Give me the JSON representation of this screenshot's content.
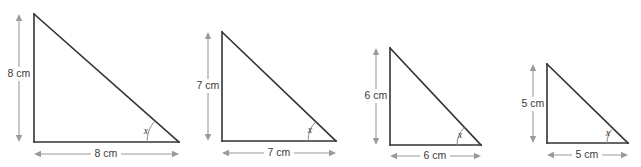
{
  "figure": {
    "type": "geometry-diagram",
    "background_color": "#ffffff",
    "line_color": "#333333",
    "dimension_color": "#9a9a9a",
    "text_color": "#3b3b3b",
    "triangles": [
      {
        "id": "triangle-1",
        "vertical_label": "8 cm",
        "horizontal_label": "8 cm",
        "angle_label": "x",
        "apex": {
          "x": 34,
          "y": 14
        },
        "right_angle": {
          "x": 34,
          "y": 142
        },
        "base_end": {
          "x": 179,
          "y": 142
        },
        "v_dim_x": 19,
        "h_dim_y": 154,
        "v_label_pos": {
          "x": 19,
          "y": 74
        },
        "h_label_pos": {
          "x": 106,
          "y": 154
        },
        "angle_radius": 32,
        "angle_label_pos": {
          "x": 146,
          "y": 132
        }
      },
      {
        "id": "triangle-2",
        "vertical_label": "7 cm",
        "horizontal_label": "7 cm",
        "angle_label": "x",
        "apex": {
          "x": 222,
          "y": 32
        },
        "right_angle": {
          "x": 222,
          "y": 141
        },
        "base_end": {
          "x": 336,
          "y": 141
        },
        "v_dim_x": 208,
        "h_dim_y": 153,
        "v_label_pos": {
          "x": 208,
          "y": 86
        },
        "h_label_pos": {
          "x": 279,
          "y": 153
        },
        "angle_radius": 28,
        "angle_label_pos": {
          "x": 310,
          "y": 131
        }
      },
      {
        "id": "triangle-3",
        "vertical_label": "6 cm",
        "horizontal_label": "6 cm",
        "angle_label": "x",
        "apex": {
          "x": 390,
          "y": 48
        },
        "right_angle": {
          "x": 390,
          "y": 145
        },
        "base_end": {
          "x": 481,
          "y": 145
        },
        "v_dim_x": 376,
        "h_dim_y": 156,
        "v_label_pos": {
          "x": 376,
          "y": 96
        },
        "h_label_pos": {
          "x": 435,
          "y": 156
        },
        "angle_radius": 24,
        "angle_label_pos": {
          "x": 460,
          "y": 136
        }
      },
      {
        "id": "triangle-4",
        "vertical_label": "5 cm",
        "horizontal_label": "5 cm",
        "angle_label": "x",
        "apex": {
          "x": 547,
          "y": 64
        },
        "right_angle": {
          "x": 547,
          "y": 143
        },
        "base_end": {
          "x": 628,
          "y": 143
        },
        "v_dim_x": 533,
        "h_dim_y": 155,
        "v_label_pos": {
          "x": 533,
          "y": 104
        },
        "h_label_pos": {
          "x": 587,
          "y": 155
        },
        "angle_radius": 21,
        "angle_label_pos": {
          "x": 608,
          "y": 134
        }
      }
    ]
  }
}
